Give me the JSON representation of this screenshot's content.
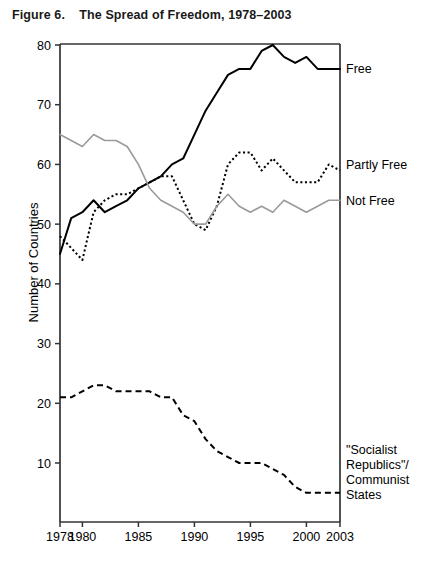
{
  "figure": {
    "title": "Figure 6.    The Spread of Freedom, 1978–2003",
    "y_axis_title": "Number of Countries"
  },
  "chart_data": {
    "type": "line",
    "title": "Figure 6.    The Spread of Freedom, 1978–2003",
    "xlabel": "",
    "ylabel": "Number of Countries",
    "xlim": [
      1978,
      2003
    ],
    "ylim": [
      3,
      80
    ],
    "grid": false,
    "legend_position": "right-inline",
    "x_tick_labels": [
      "1978",
      "1980",
      "1985",
      "1990",
      "1995",
      "2000",
      "2003"
    ],
    "x_ticks": [
      1978,
      1980,
      1985,
      1990,
      1995,
      2000,
      2003
    ],
    "y_tick_labels": [
      "10",
      "20",
      "30",
      "40",
      "50",
      "60",
      "70",
      "80"
    ],
    "y_ticks": [
      10,
      20,
      30,
      40,
      50,
      60,
      70,
      80
    ],
    "x": [
      1978,
      1979,
      1980,
      1981,
      1982,
      1983,
      1984,
      1985,
      1986,
      1987,
      1988,
      1989,
      1990,
      1991,
      1992,
      1993,
      1994,
      1995,
      1996,
      1997,
      1998,
      1999,
      2000,
      2001,
      2002,
      2003
    ],
    "series": [
      {
        "name": "Free",
        "label": "Free",
        "style": "solid",
        "color": "#000000",
        "width": 2,
        "label_position": {
          "x": 2003,
          "y": 76
        },
        "values": [
          45,
          51,
          52,
          54,
          52,
          53,
          54,
          56,
          57,
          58,
          60,
          61,
          65,
          69,
          72,
          75,
          76,
          76,
          79,
          80,
          78,
          77,
          78,
          76,
          76,
          76
        ]
      },
      {
        "name": "Partly Free",
        "label": "Partly Free",
        "style": "dotted",
        "color": "#000000",
        "width": 2,
        "label_position": {
          "x": 2003,
          "y": 60
        },
        "values": [
          48,
          46,
          44,
          52,
          54,
          55,
          55,
          56,
          57,
          58,
          58,
          54,
          50,
          49,
          53,
          60,
          62,
          62,
          59,
          61,
          59,
          57,
          57,
          57,
          60,
          59
        ]
      },
      {
        "name": "Not Free",
        "label": "Not Free",
        "style": "solid",
        "color": "#9a9a9a",
        "width": 1.6,
        "label_position": {
          "x": 2003,
          "y": 54
        },
        "values": [
          65,
          64,
          63,
          65,
          64,
          64,
          63,
          60,
          56,
          54,
          53,
          52,
          50,
          50,
          53,
          55,
          53,
          52,
          53,
          52,
          54,
          53,
          52,
          53,
          54,
          54
        ]
      },
      {
        "name": "\"Socialist Republics\"/ Communist States",
        "label": "\"Socialist Republics\"/ Communist States",
        "label_lines": [
          "\"Socialist",
          "Republics\"/",
          "Communist",
          "States"
        ],
        "style": "dashed",
        "color": "#000000",
        "width": 2,
        "label_position": {
          "x": 2003,
          "y": 5
        },
        "values": [
          21,
          21,
          22,
          23,
          23,
          22,
          22,
          22,
          22,
          21,
          21,
          18,
          17,
          14,
          12,
          11,
          10,
          10,
          10,
          9,
          8,
          6,
          5,
          5,
          5,
          5
        ]
      }
    ]
  }
}
